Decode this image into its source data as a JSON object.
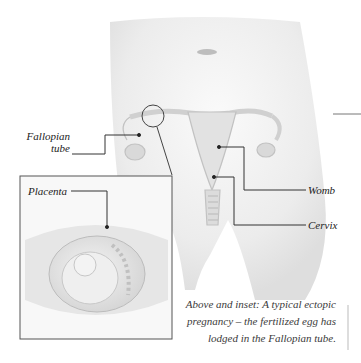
{
  "labels": {
    "fallopian_line1": "Fallopian",
    "fallopian_line2": "tube",
    "placenta": "Placenta",
    "womb": "Womb",
    "cervix": "Cervix"
  },
  "caption": {
    "line1": "Above and inset: A typical ectopic",
    "line2": "pregnancy – the fertilized egg has",
    "line3": "lodged in the Fallopian tube."
  },
  "colors": {
    "line": "#333333",
    "body_shade": "#e8e8e8",
    "organ": "#d8d8d8",
    "inset_border": "#555555"
  }
}
